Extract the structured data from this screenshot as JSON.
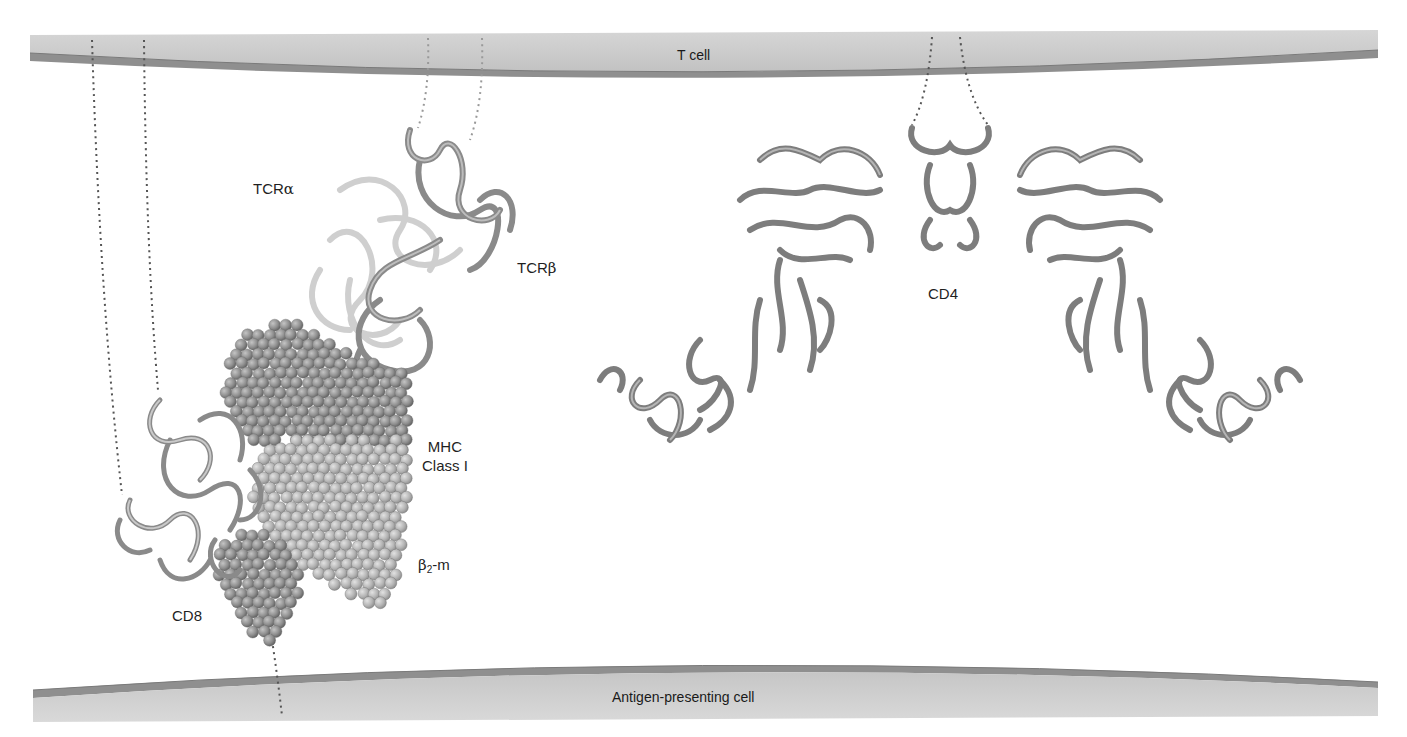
{
  "diagram": {
    "colors": {
      "background": "#ffffff",
      "membrane_fill": "#c9c9c9",
      "membrane_edge": "#8f8f8f",
      "ribbon_dark": "#7b7b7b",
      "ribbon_light": "#d4d4d4",
      "sphere_dark": "#8d8d8d",
      "sphere_light": "#b3b3b3",
      "tether_dots": "#555555",
      "text": "#1f1f1f"
    },
    "membranes": {
      "top": {
        "label": "T cell"
      },
      "bottom": {
        "label": "Antigen-presenting cell"
      }
    },
    "molecules": {
      "tcr_alpha": {
        "label_prefix": "TCR",
        "label_greek": "α"
      },
      "tcr_beta": {
        "label_prefix": "TCR",
        "label_greek": "β"
      },
      "mhc": {
        "line1": "MHC",
        "line2": "Class I"
      },
      "b2m": {
        "label_greek": "β",
        "label_sub": "2",
        "label_suffix": "-m"
      },
      "cd8": {
        "label": "CD8"
      },
      "cd4": {
        "label": "CD4"
      }
    }
  }
}
